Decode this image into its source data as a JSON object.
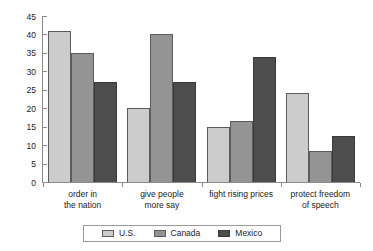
{
  "chart_data": {
    "type": "bar",
    "title": "",
    "subtitle": "",
    "xlabel": "",
    "ylabel": "",
    "ylim": [
      0,
      45
    ],
    "ytick_values": [
      0,
      5,
      10,
      15,
      20,
      25,
      30,
      35,
      40,
      45
    ],
    "ytick_labels": [
      "0",
      "5",
      "10",
      "15",
      "20",
      "25",
      "30",
      "35",
      "40",
      "45"
    ],
    "grid": false,
    "legend_position": "bottom",
    "categories": [
      "order in the nation",
      "give people more say",
      "fight rising prices",
      "protect freedom of speech"
    ],
    "category_lines": [
      [
        "order in",
        "the nation"
      ],
      [
        "give people",
        "more say"
      ],
      [
        "fight rising prices",
        ""
      ],
      [
        "protect freedom",
        "of speech"
      ]
    ],
    "series": [
      {
        "name": "U.S.",
        "color": "#cccccc",
        "values": [
          41,
          20,
          15,
          24
        ]
      },
      {
        "name": "Canada",
        "color": "#949494",
        "values": [
          35,
          40,
          16.5,
          8.5
        ]
      },
      {
        "name": "Mexico",
        "color": "#4d4d4d",
        "values": [
          27,
          27,
          34,
          12.5
        ]
      }
    ]
  },
  "legend": {
    "items": [
      {
        "label": "U.S."
      },
      {
        "label": "Canada"
      },
      {
        "label": "Mexico"
      }
    ]
  }
}
